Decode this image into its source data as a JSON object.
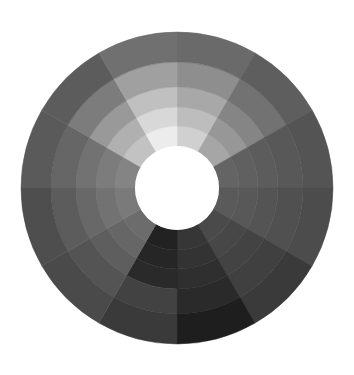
{
  "figure": {
    "type": "grayscale-color-wheel",
    "center": {
      "x": 177,
      "y": 188
    },
    "inner_radius": 42,
    "ring_radii": [
      42,
      62,
      81,
      101,
      126,
      156
    ],
    "sector_count": 12,
    "start_angle_deg": -90,
    "hole_color": "#ffffff",
    "background_color": "#ffffff"
  },
  "sectors": [
    {
      "label": "sector-1",
      "colors": [
        "#d0d0d0",
        "#bdbdbd",
        "#a8a8a8",
        "#8e8e8e",
        "#6a6a6a"
      ]
    },
    {
      "label": "sector-2",
      "colors": [
        "#a6a6a6",
        "#979797",
        "#858585",
        "#727272",
        "#5e5e5e"
      ]
    },
    {
      "label": "sector-3",
      "colors": [
        "#646464",
        "#606060",
        "#5c5c5c",
        "#585858",
        "#545454"
      ]
    },
    {
      "label": "sector-4",
      "colors": [
        "#5a5a5a",
        "#585858",
        "#545454",
        "#505050",
        "#4c4c4c"
      ]
    },
    {
      "label": "sector-5",
      "colors": [
        "#4a4a4a",
        "#474747",
        "#434343",
        "#404040",
        "#3a3a3a"
      ]
    },
    {
      "label": "sector-6",
      "colors": [
        "#363636",
        "#333333",
        "#2f2f2f",
        "#2a2a2a",
        "#1e1e1e"
      ]
    },
    {
      "label": "sector-7",
      "colors": [
        "#222222",
        "#262626",
        "#2a2a2a",
        "#424242",
        "#3a3a3a"
      ]
    },
    {
      "label": "sector-8",
      "colors": [
        "#6c6c6c",
        "#666666",
        "#5e5e5e",
        "#545454",
        "#4a4a4a"
      ]
    },
    {
      "label": "sector-9",
      "colors": [
        "#7a7a7a",
        "#727272",
        "#686868",
        "#5c5c5c",
        "#4e4e4e"
      ]
    },
    {
      "label": "sector-10",
      "colors": [
        "#848484",
        "#7c7c7c",
        "#727272",
        "#666666",
        "#5a5a5a"
      ]
    },
    {
      "label": "sector-11",
      "colors": [
        "#c2c2c2",
        "#b0b0b0",
        "#999999",
        "#7c7c7c",
        "#5c5c5c"
      ]
    },
    {
      "label": "sector-12",
      "colors": [
        "#ececec",
        "#d8d8d8",
        "#c0c0c0",
        "#a0a0a0",
        "#707070"
      ]
    }
  ]
}
